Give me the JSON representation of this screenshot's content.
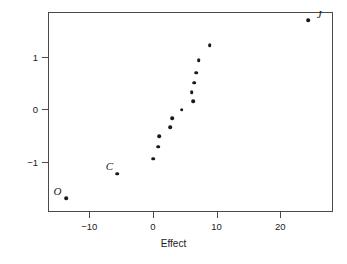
{
  "chart_data": {
    "type": "scatter",
    "title": "",
    "xlabel": "Effect",
    "ylabel": "Normal score",
    "xlim": [
      -16.5,
      28.3
    ],
    "ylim": [
      -1.95,
      1.85
    ],
    "xticks": [
      -10,
      0,
      10,
      20
    ],
    "xtick_labels": [
      "−10",
      "0",
      "10",
      "20"
    ],
    "yticks": [
      -1,
      0,
      1
    ],
    "ytick_labels": [
      "−1",
      "0",
      "1"
    ],
    "grid": false,
    "legend": "none",
    "marker_color": "#1a1a1a",
    "frame_color": "#4a4a4a",
    "points": [
      {
        "x": -13.6,
        "y": -1.69,
        "label": "O",
        "label_dx": -9,
        "label_dy": -7
      },
      {
        "x": -5.6,
        "y": -1.22,
        "label": "C",
        "label_dx": -8,
        "label_dy": -8
      },
      {
        "x": 0.0,
        "y": -0.94,
        "label": "",
        "label_dx": 0,
        "label_dy": 0
      },
      {
        "x": 0.8,
        "y": -0.71,
        "label": "",
        "label_dx": 0,
        "label_dy": 0
      },
      {
        "x": 1.0,
        "y": -0.51,
        "label": "",
        "label_dx": 0,
        "label_dy": 0
      },
      {
        "x": 2.7,
        "y": -0.34,
        "label": "",
        "label_dx": 0,
        "label_dy": 0
      },
      {
        "x": 3.0,
        "y": -0.17,
        "label": "",
        "label_dx": 0,
        "label_dy": 0
      },
      {
        "x": 4.5,
        "y": -0.01,
        "label": "",
        "label_dx": 0,
        "label_dy": 0
      },
      {
        "x": 6.3,
        "y": 0.16,
        "label": "",
        "label_dx": 0,
        "label_dy": 0
      },
      {
        "x": 6.1,
        "y": 0.33,
        "label": "",
        "label_dx": 0,
        "label_dy": 0
      },
      {
        "x": 6.5,
        "y": 0.51,
        "label": "",
        "label_dx": 0,
        "label_dy": 0
      },
      {
        "x": 6.8,
        "y": 0.7,
        "label": "",
        "label_dx": 0,
        "label_dy": 0
      },
      {
        "x": 7.2,
        "y": 0.93,
        "label": "",
        "label_dx": 0,
        "label_dy": 0
      },
      {
        "x": 8.9,
        "y": 1.22,
        "label": "",
        "label_dx": 0,
        "label_dy": 0
      },
      {
        "x": 24.4,
        "y": 1.69,
        "label": "J",
        "label_dx": 11,
        "label_dy": -6
      }
    ]
  }
}
